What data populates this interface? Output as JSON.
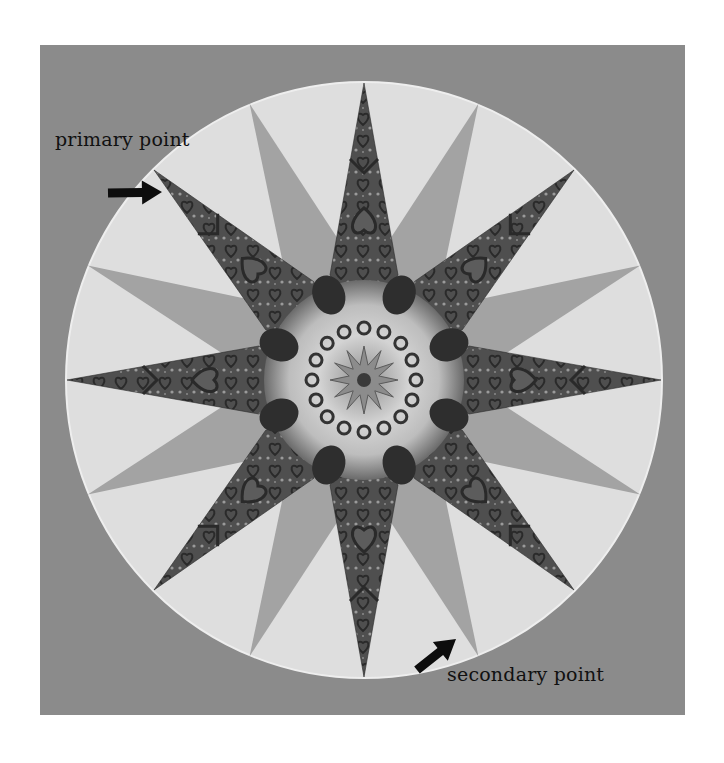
{
  "figure": {
    "background_color": "#ffffff",
    "panel": {
      "x": 40,
      "y": 45,
      "width": 645,
      "height": 670,
      "color": "#8b8b8b"
    },
    "circle": {
      "cx": 364,
      "cy": 380,
      "r": 298,
      "fill": "#dedede",
      "stroke": "#eeeeee"
    },
    "star": {
      "center": [
        364,
        380
      ],
      "primary_points": {
        "count": 8,
        "start_angle_deg": -90,
        "tip_radius": 297,
        "base_radius": 105,
        "base_half_width": 34,
        "fill": "#4f4f4f",
        "pattern_accent": "#2a2a2a",
        "pattern_light": "#9a9a9a"
      },
      "secondary_points": {
        "count": 8,
        "start_angle_deg": -67.5,
        "tip_radius": 299,
        "base_radius": 140,
        "base_half_width": 30,
        "fill": "#a3a3a3"
      },
      "medallion": {
        "radius": 118,
        "fill": "#6a6a6a",
        "ring_light": "#d9d9d9",
        "blob_count": 8,
        "blob_radius_pos": 78,
        "blob_size": 20,
        "blob_color": "#2e2e2e",
        "inner_star_radius": 34,
        "inner_star_color": "#8c8c8c",
        "core_color": "#3a3a3a"
      }
    }
  },
  "annotations": {
    "primary": {
      "text": "primary point",
      "arrow": {
        "from": [
          108,
          193
        ],
        "to": [
          162,
          192
        ]
      }
    },
    "secondary": {
      "text": "secondary point",
      "arrow": {
        "from": [
          417,
          670
        ],
        "to": [
          456,
          639
        ]
      }
    }
  }
}
